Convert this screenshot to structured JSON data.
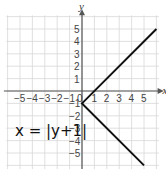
{
  "chart_data": {
    "type": "line",
    "title": "",
    "xlabel": "x",
    "ylabel": "y",
    "xlim": [
      -6.3,
      6.3
    ],
    "ylim": [
      -6.3,
      6.3
    ],
    "grid": true,
    "x_ticks": [
      "-5",
      "-4",
      "-3",
      "-2",
      "-1",
      "0",
      "1",
      "2",
      "3",
      "4",
      "5"
    ],
    "y_ticks": [
      "5",
      "4",
      "3",
      "2",
      "1",
      "-1",
      "-2",
      "-3",
      "-4",
      "-5"
    ],
    "series": [
      {
        "name": "x = |y+1|",
        "points": [
          [
            6,
            5
          ],
          [
            0,
            -1
          ],
          [
            5,
            -6
          ]
        ]
      }
    ],
    "annotations": [
      {
        "text": "x = |y+1|",
        "x": -6,
        "y": -2.5
      }
    ],
    "colors": {
      "line": "#111111",
      "grid": "#d8d8d8",
      "axis": "#555555"
    }
  }
}
